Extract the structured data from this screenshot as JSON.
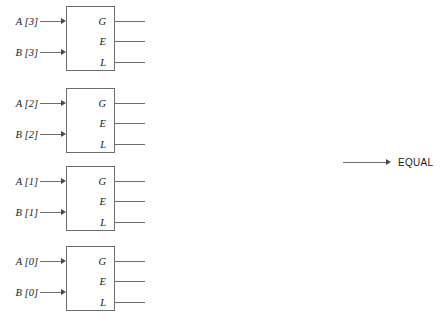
{
  "diagram": {
    "line_color": "#6e6e6e",
    "text_color": "#1a1a1a",
    "arrow_color": "#4a4a4a",
    "background": "#ffffff",
    "blocks": [
      {
        "id": "bit3",
        "inputs": [
          {
            "label": "A [3]",
            "name": "input-a3"
          },
          {
            "label": "B [3]",
            "name": "input-b3"
          }
        ],
        "outputs": [
          {
            "label": "G",
            "name": "output-g3"
          },
          {
            "label": "E",
            "name": "output-e3"
          },
          {
            "label": "L",
            "name": "output-l3"
          }
        ]
      },
      {
        "id": "bit2",
        "inputs": [
          {
            "label": "A [2]",
            "name": "input-a2"
          },
          {
            "label": "B [2]",
            "name": "input-b2"
          }
        ],
        "outputs": [
          {
            "label": "G",
            "name": "output-g2"
          },
          {
            "label": "E",
            "name": "output-e2"
          },
          {
            "label": "L",
            "name": "output-l2"
          }
        ]
      },
      {
        "id": "bit1",
        "inputs": [
          {
            "label": "A [1]",
            "name": "input-a1"
          },
          {
            "label": "B [1]",
            "name": "input-b1"
          }
        ],
        "outputs": [
          {
            "label": "G",
            "name": "output-g1"
          },
          {
            "label": "E",
            "name": "output-e1"
          },
          {
            "label": "L",
            "name": "output-l1"
          }
        ]
      },
      {
        "id": "bit0",
        "inputs": [
          {
            "label": "A [0]",
            "name": "input-a0"
          },
          {
            "label": "B [0]",
            "name": "input-b0"
          }
        ],
        "outputs": [
          {
            "label": "G",
            "name": "output-g0"
          },
          {
            "label": "E",
            "name": "output-e0"
          },
          {
            "label": "L",
            "name": "output-l0"
          }
        ]
      }
    ],
    "result": {
      "label": "EQUAL"
    },
    "caption": ""
  }
}
